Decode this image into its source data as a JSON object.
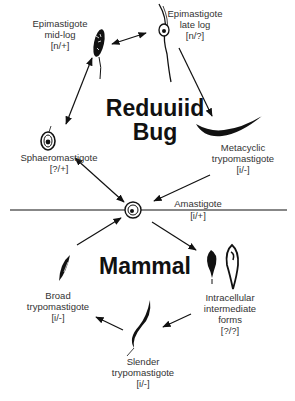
{
  "diagram": {
    "regions": {
      "top": "Reduuiid\nBug",
      "top_line1": "Reduuiid",
      "top_line2": "Bug",
      "bottom": "Mammal"
    },
    "stages": [
      {
        "id": "epi_mid",
        "name_line1": "Epimastigote",
        "name_line2": "mid-log",
        "code": "[n/+]"
      },
      {
        "id": "epi_late",
        "name_line1": "Epimastigote",
        "name_line2": "late log",
        "code": "[n/?]"
      },
      {
        "id": "metacyclic",
        "name_line1": "Metacyclic",
        "name_line2": "trypomastigote",
        "code": "[i/-]"
      },
      {
        "id": "amastigote",
        "name_line1": "Amastigote",
        "code": "[i/+]"
      },
      {
        "id": "sphaero",
        "name_line1": "Sphaeromastigote",
        "code": "[?/+]"
      },
      {
        "id": "intracellular",
        "name_line1": "Intracellular",
        "name_line2": "intermediate",
        "name_line3": "forms",
        "code": "[?/?]"
      },
      {
        "id": "slender",
        "name_line1": "Slender",
        "name_line2": "trypomastigote",
        "code": "[i/-]"
      },
      {
        "id": "broad",
        "name_line1": "Broad",
        "name_line2": "trypomastigote",
        "code": "[i/-]"
      }
    ],
    "edges": [
      {
        "from": "epi_mid",
        "to": "epi_late",
        "bidirectional": true
      },
      {
        "from": "epi_late",
        "to": "metacyclic",
        "bidirectional": false
      },
      {
        "from": "metacyclic",
        "to": "amastigote",
        "bidirectional": false
      },
      {
        "from": "epi_mid",
        "to": "sphaero",
        "bidirectional": true
      },
      {
        "from": "sphaero",
        "to": "amastigote",
        "bidirectional": true
      },
      {
        "from": "amastigote",
        "to": "intracellular",
        "bidirectional": false
      },
      {
        "from": "intracellular",
        "to": "slender",
        "bidirectional": false
      },
      {
        "from": "slender",
        "to": "broad",
        "bidirectional": false
      },
      {
        "from": "broad",
        "to": "amastigote",
        "bidirectional": false
      }
    ],
    "colors": {
      "ink": "#111111",
      "text": "#333333",
      "background": "#ffffff"
    }
  }
}
